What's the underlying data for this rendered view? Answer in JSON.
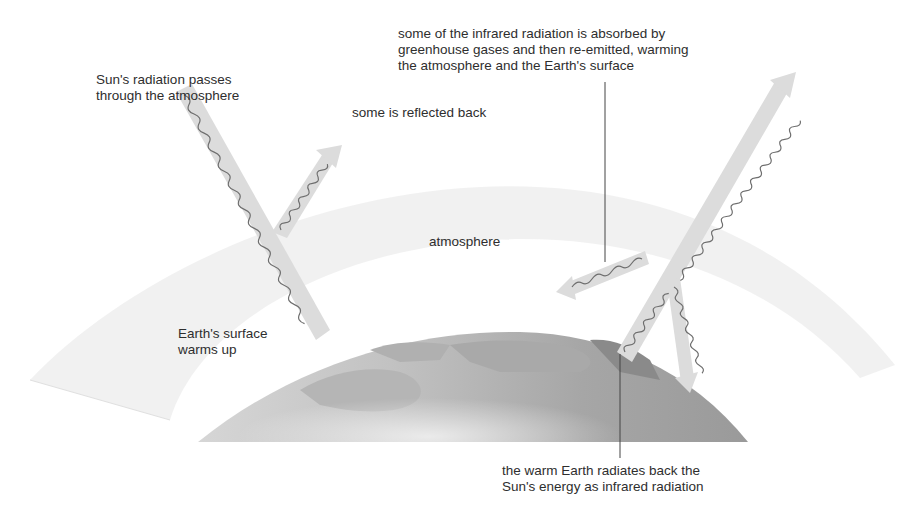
{
  "diagram": {
    "labels": {
      "sun_radiation": [
        "Sun's radiation passes",
        "through the atmosphere"
      ],
      "reflected": "some is reflected back",
      "absorbed": [
        "some of the infrared radiation is absorbed by",
        "greenhouse gases and then re-emitted, warming",
        "the atmosphere and the Earth's surface"
      ],
      "atmosphere": "atmosphere",
      "surface_warms": [
        "Earth's surface",
        "warms up"
      ],
      "earth_radiates": [
        "the warm Earth radiates back the",
        "Sun's energy as infrared radiation"
      ]
    },
    "colors": {
      "background": "#ffffff",
      "atmosphere_band": "#ececec",
      "earth": "#a8a8a8",
      "earth_dark": "#8c8c8c",
      "land": "#bdbdbd",
      "arrow_fill": "#dcdcdc",
      "wave": "#6e6e6e",
      "leader_line": "#444444",
      "text": "#2e2e2e"
    },
    "arrows": [
      {
        "name": "incoming-sun-radiation",
        "from": [
          185,
          88
        ],
        "to": [
          322,
          336
        ],
        "direction": "down"
      },
      {
        "name": "reflected-radiation",
        "from": [
          279,
          232
        ],
        "to": [
          335,
          148
        ],
        "direction": "up"
      },
      {
        "name": "escaping-infrared",
        "from": [
          627,
          356
        ],
        "to": [
          790,
          77
        ],
        "direction": "up"
      },
      {
        "name": "re-emitted-sideways",
        "from": [
          645,
          255
        ],
        "to": [
          558,
          290
        ],
        "direction": "left"
      },
      {
        "name": "re-emitted-down",
        "from": [
          672,
          283
        ],
        "to": [
          691,
          393
        ],
        "direction": "down"
      }
    ]
  }
}
